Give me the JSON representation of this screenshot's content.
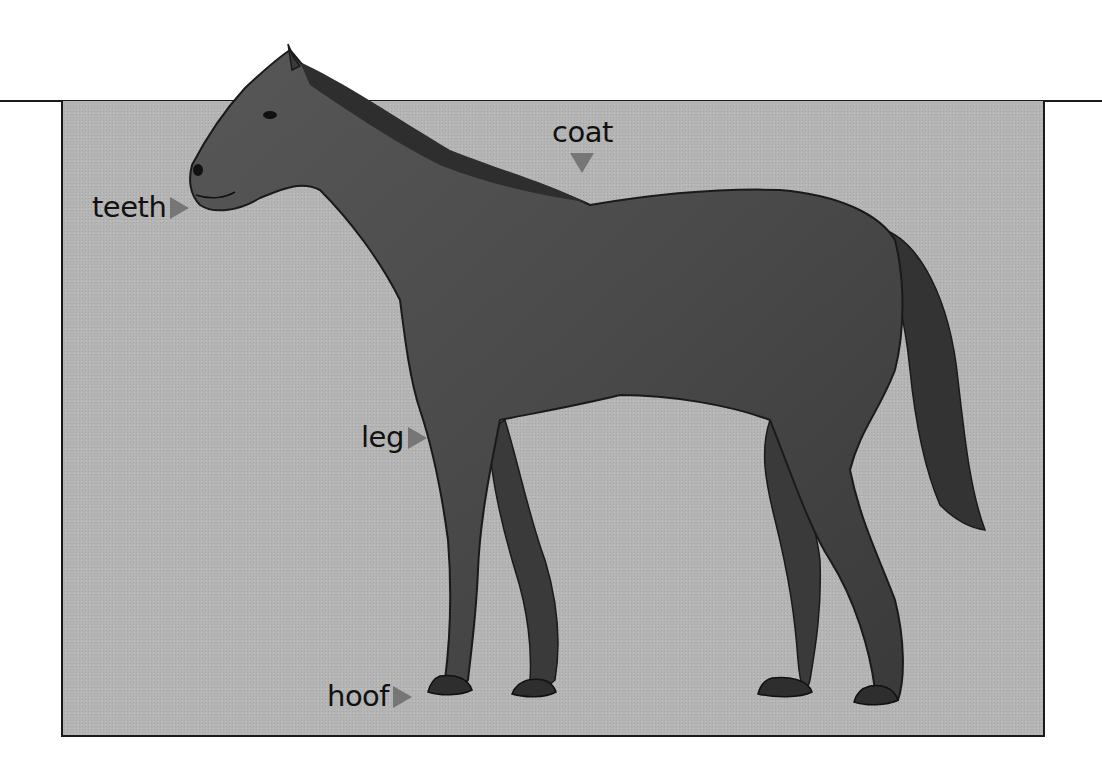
{
  "diagram": {
    "labels": [
      {
        "id": "teeth",
        "text": "teeth",
        "arrow": "right"
      },
      {
        "id": "coat",
        "text": "coat",
        "arrow": "down"
      },
      {
        "id": "leg",
        "text": "leg",
        "arrow": "right"
      },
      {
        "id": "hoof",
        "text": "hoof",
        "arrow": "right"
      }
    ]
  },
  "colors": {
    "background": "#b4b4b4",
    "horse": "#4a4a4a",
    "horse_dark": "#2e2e2e",
    "arrow": "#767676",
    "border": "#1a1a1a",
    "text": "#111111"
  }
}
